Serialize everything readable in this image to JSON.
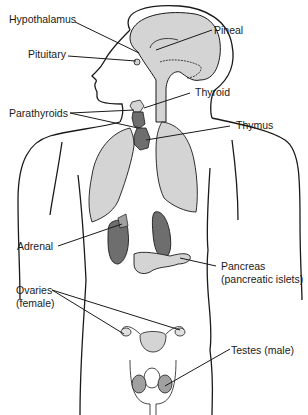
{
  "colors": {
    "outline": "#1a1a1a",
    "light_fill": "#d4d4d4",
    "dark_fill": "#6e6e6e",
    "background": "#ffffff"
  },
  "labels": {
    "hypothalamus": "Hypothalamus",
    "pineal": "Pineal",
    "pituitary": "Pituitary",
    "thyroid": "Thyroid",
    "parathyroids": "Parathyroids",
    "thymus": "Thymus",
    "adrenal": "Adrenal",
    "pancreas_line1": "Pancreas",
    "pancreas_line2": "(pancreatic islets)",
    "ovaries_line1": "Ovaries",
    "ovaries_line2": "(female)",
    "testes": "Testes (male)"
  }
}
